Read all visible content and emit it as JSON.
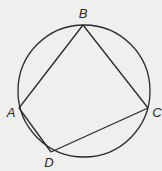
{
  "diagram": {
    "colors": {
      "background": "#efefed",
      "stroke": "#2a2a2a",
      "label": "#2a2a2a"
    },
    "circle": {
      "cx": 84,
      "cy": 91,
      "r": 66
    },
    "points": {
      "A": {
        "x": 19,
        "y": 108,
        "label": "A",
        "label_x": 11,
        "label_y": 117
      },
      "B": {
        "x": 83,
        "y": 25,
        "label": "B",
        "label_x": 83,
        "label_y": 18
      },
      "C": {
        "x": 148,
        "y": 108,
        "label": "C",
        "label_x": 157,
        "label_y": 117
      },
      "D": {
        "x": 51,
        "y": 152,
        "label": "D",
        "label_x": 49,
        "label_y": 167
      }
    },
    "segments": [
      {
        "from": "A",
        "to": "B"
      },
      {
        "from": "B",
        "to": "C"
      },
      {
        "from": "C",
        "to": "D"
      },
      {
        "from": "D",
        "to": "A"
      }
    ],
    "labels": {
      "A": "A",
      "B": "B",
      "C": "C",
      "D": "D"
    }
  }
}
